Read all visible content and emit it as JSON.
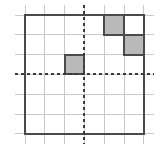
{
  "figure": {
    "canvas": {
      "width": 161,
      "height": 154,
      "background": "#ffffff"
    },
    "grid": {
      "columns": 6,
      "rows": 6,
      "cell_size": 19.8,
      "origin_x": 25,
      "origin_y": 15,
      "border_color": "#4a4a4a",
      "border_width": 2,
      "line_color": "#c9c9c9",
      "line_width": 1,
      "overhang": 10
    },
    "axes": {
      "vertical": {
        "name": "y-axis",
        "x": 84.4,
        "dash": "3 3",
        "color": "#3a3a3a",
        "width": 2
      },
      "horizontal": {
        "name": "x-axis",
        "y": 74.4,
        "dash": "3 3",
        "color": "#3a3a3a",
        "width": 2
      }
    },
    "shaded_cells": [
      {
        "name": "shaded-cell-r1c5",
        "col": 5,
        "row": 1,
        "fill": "#b9b9b9",
        "stroke": "#4a4a4a"
      },
      {
        "name": "shaded-cell-r2c6",
        "col": 6,
        "row": 2,
        "fill": "#b9b9b9",
        "stroke": "#4a4a4a"
      },
      {
        "name": "shaded-cell-r3c3",
        "col": 3,
        "row": 3,
        "fill": "#b9b9b9",
        "stroke": "#4a4a4a"
      }
    ]
  }
}
